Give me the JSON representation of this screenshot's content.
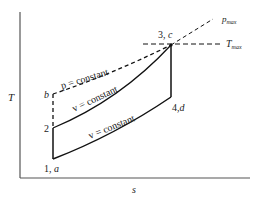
{
  "diagram": {
    "type": "T-s diagram (Otto cycle with constant-pressure reference)",
    "axes": {
      "x_label": "s",
      "y_label": "T"
    },
    "points": [
      {
        "id": "1a",
        "label": "1, a",
        "x": 53,
        "y": 159
      },
      {
        "id": "2",
        "label": "2",
        "x": 53,
        "y": 128
      },
      {
        "id": "b",
        "label": "b",
        "x": 53,
        "y": 94
      },
      {
        "id": "3c",
        "label": "3, c",
        "x": 171,
        "y": 45
      },
      {
        "id": "4d",
        "label": "4, d",
        "x": 171,
        "y": 97
      }
    ],
    "curve_labels": {
      "p_const": "p = constant",
      "v_const_upper": "v = constant",
      "v_const_lower": "v = constant"
    },
    "reference_lines": {
      "p_max": "p",
      "p_max_sub": "max",
      "t_max": "T",
      "t_max_sub": "max"
    },
    "colors": {
      "line": "#111111",
      "axis": "#555555",
      "text": "#222222"
    }
  }
}
